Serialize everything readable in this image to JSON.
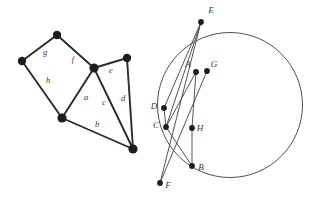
{
  "figure": {
    "background_color": "#ffffff",
    "stroke_color": "#2b2b2b",
    "thin_stroke_color": "#4a4a4a",
    "node_color": "#1d1d1d",
    "label_color": "#3a3a3a"
  },
  "left_graph": {
    "name": "planar-graph",
    "vertices": [
      {
        "id": "v1",
        "x": 57,
        "y": 35,
        "r": 4.2
      },
      {
        "id": "v2",
        "x": 22,
        "y": 61,
        "r": 4.2
      },
      {
        "id": "v3",
        "x": 94,
        "y": 68,
        "r": 4.6
      },
      {
        "id": "v4",
        "x": 127,
        "y": 58,
        "r": 4.2
      },
      {
        "id": "v5",
        "x": 62,
        "y": 118,
        "r": 4.6
      },
      {
        "id": "v6",
        "x": 133,
        "y": 149,
        "r": 4.6
      }
    ],
    "edges": [
      {
        "id": "e-g",
        "from": "v1",
        "to": "v2",
        "label": "g"
      },
      {
        "id": "e-f",
        "from": "v1",
        "to": "v3",
        "label": "f"
      },
      {
        "id": "e-h",
        "from": "v2",
        "to": "v5",
        "label": "h"
      },
      {
        "id": "e-a",
        "from": "v3",
        "to": "v5",
        "label": "a"
      },
      {
        "id": "e-e",
        "from": "v3",
        "to": "v4",
        "label": "e"
      },
      {
        "id": "e-c",
        "from": "v3",
        "to": "v6",
        "label": "c"
      },
      {
        "id": "e-d",
        "from": "v4",
        "to": "v6",
        "label": "d"
      },
      {
        "id": "e-b",
        "from": "v5",
        "to": "v6",
        "label": "b"
      }
    ],
    "edge_labels": [
      {
        "text": "g",
        "x": 45,
        "y": 55
      },
      {
        "text": "f",
        "x": 73,
        "y": 62
      },
      {
        "text": "h",
        "x": 48,
        "y": 83
      },
      {
        "text": "a",
        "x": 86,
        "y": 100
      },
      {
        "text": "e",
        "x": 111,
        "y": 73
      },
      {
        "text": "c",
        "x": 104,
        "y": 105
      },
      {
        "text": "d",
        "x": 123,
        "y": 101
      },
      {
        "text": "b",
        "x": 97,
        "y": 127
      }
    ]
  },
  "right_figure": {
    "name": "circle-with-chords",
    "circle": {
      "cx": 230,
      "cy": 105,
      "r": 72.5
    },
    "points": [
      {
        "id": "A",
        "label": "A",
        "x": 196,
        "y": 72,
        "lx": 188,
        "ly": 67
      },
      {
        "id": "B",
        "label": "B",
        "x": 192,
        "y": 166,
        "lx": 201,
        "ly": 170
      },
      {
        "id": "C",
        "label": "C",
        "x": 166,
        "y": 127,
        "lx": 156,
        "ly": 128
      },
      {
        "id": "D",
        "label": "D",
        "x": 164,
        "y": 108,
        "lx": 154,
        "ly": 109
      },
      {
        "id": "E",
        "label": "E",
        "x": 201,
        "y": 22,
        "lx": 211,
        "ly": 13
      },
      {
        "id": "F",
        "label": "F",
        "x": 160,
        "y": 183,
        "lx": 168,
        "ly": 188
      },
      {
        "id": "G",
        "label": "G",
        "x": 207,
        "y": 71,
        "lx": 214,
        "ly": 67
      },
      {
        "id": "H",
        "label": "H",
        "x": 192,
        "y": 128,
        "lx": 200,
        "ly": 131
      }
    ],
    "segments": [
      {
        "id": "seg-ED",
        "from": "E",
        "to": "D"
      },
      {
        "id": "seg-EC",
        "from": "E",
        "to": "C"
      },
      {
        "id": "seg-EF",
        "from": "E",
        "to": "F"
      },
      {
        "id": "seg-DC",
        "from": "D",
        "to": "C"
      },
      {
        "id": "seg-CA",
        "from": "C",
        "to": "A"
      },
      {
        "id": "seg-AH",
        "from": "A",
        "to": "H"
      },
      {
        "id": "seg-GF",
        "from": "G",
        "to": "F"
      },
      {
        "id": "seg-HB",
        "from": "H",
        "to": "B"
      },
      {
        "id": "seg-CB",
        "from": "C",
        "to": "B"
      }
    ]
  }
}
